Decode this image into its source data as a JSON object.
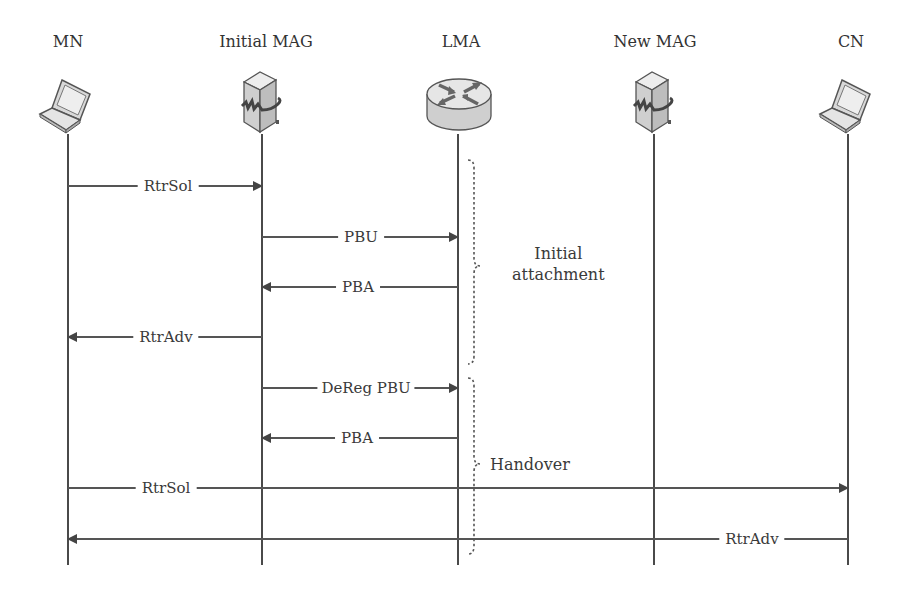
{
  "diagram": {
    "type": "sequence",
    "entities": [
      {
        "id": "mn",
        "label": "MN",
        "icon": "laptop-icon",
        "x": 68
      },
      {
        "id": "initial_mag",
        "label": "Initial MAG",
        "icon": "mag-server-icon",
        "x": 262
      },
      {
        "id": "lma",
        "label": "LMA",
        "icon": "router-icon",
        "x": 458
      },
      {
        "id": "new_mag",
        "label": "New MAG",
        "icon": "mag-server-icon",
        "x": 654
      },
      {
        "id": "cn",
        "label": "CN",
        "icon": "laptop-icon",
        "x": 848
      }
    ],
    "messages": [
      {
        "label": "RtrSol",
        "from": "MN",
        "to": "Initial MAG",
        "y": 186
      },
      {
        "label": "PBU",
        "from": "Initial MAG",
        "to": "LMA",
        "y": 237
      },
      {
        "label": "PBA",
        "from": "LMA",
        "to": "Initial MAG",
        "y": 287
      },
      {
        "label": "RtrAdv",
        "from": "Initial MAG",
        "to": "MN",
        "y": 337
      },
      {
        "label": "DeReg PBU",
        "from": "Initial MAG",
        "to": "LMA",
        "y": 388
      },
      {
        "label": "PBA",
        "from": "LMA",
        "to": "Initial MAG",
        "y": 438
      },
      {
        "label": "RtrSol",
        "from": "MN",
        "to": "CN",
        "y": 488
      },
      {
        "label": "RtrAdv",
        "from": "CN",
        "to": "MN",
        "y": 539
      }
    ],
    "phases": [
      {
        "label_line1": "Initial",
        "label_line2": "attachment",
        "y_start": 162,
        "y_end": 362
      },
      {
        "label_line1": "Handover",
        "label_line2": "",
        "y_start": 378,
        "y_end": 553
      }
    ]
  }
}
